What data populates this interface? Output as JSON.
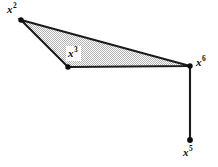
{
  "figure": {
    "background_color": "#ffffff",
    "stroke_color": "#1a1a1a",
    "fill_color": "#d9d9d9",
    "fill_pattern": "stipple-dither",
    "vertices": [
      {
        "id": "x2",
        "label": "x",
        "superscript": "2",
        "x": 21,
        "y": 20,
        "label_x": 7,
        "label_y": 4,
        "boxed": false
      },
      {
        "id": "x3",
        "label": "x",
        "superscript": "3",
        "x": 68,
        "y": 67,
        "label_x": 66,
        "label_y": 46,
        "boxed": true
      },
      {
        "id": "x6",
        "label": "x",
        "superscript": "6",
        "x": 190,
        "y": 66,
        "label_x": 196,
        "label_y": 57,
        "boxed": false
      },
      {
        "id": "x5",
        "label": "x",
        "superscript": "5",
        "x": 190,
        "y": 140,
        "label_x": 183,
        "label_y": 147,
        "boxed": false
      }
    ],
    "polygon": {
      "name": "shaded-triangle",
      "points": "21,20 190,66 68,67"
    },
    "segments": [
      {
        "name": "edge-x6-x5",
        "x1": 190,
        "y1": 66,
        "x2": 190,
        "y2": 140
      }
    ],
    "labels": {
      "x2": "x2",
      "x3": "x3",
      "x6": "x6",
      "x5": "x5"
    }
  }
}
